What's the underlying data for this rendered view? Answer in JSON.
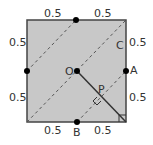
{
  "diagram": {
    "colors": {
      "fill": "#c8c8c8",
      "border": "#444444",
      "dashed": "#555555",
      "solid": "#333333",
      "point": "#000000",
      "text": "#333333"
    },
    "square": {
      "x1": 27,
      "y1": 20,
      "x2": 126,
      "y2": 122
    },
    "points": [
      {
        "id": "top-mid",
        "label": "",
        "x": 76,
        "y": 20
      },
      {
        "id": "left-mid",
        "label": "",
        "x": 27,
        "y": 71
      },
      {
        "id": "O",
        "label": "O",
        "x": 77,
        "y": 71
      },
      {
        "id": "A",
        "label": "A",
        "x": 126,
        "y": 71
      },
      {
        "id": "B",
        "label": "B",
        "x": 77,
        "y": 122
      }
    ],
    "labels": {
      "O": "O",
      "A": "A",
      "B": "B",
      "C": "C",
      "P": "P"
    },
    "side_labels": {
      "top_left": "0.5",
      "top_right": "0.5",
      "left_top": "0.5",
      "left_bottom": "0.5",
      "right_top": "0.5",
      "right_bottom": "0.5",
      "bottom_left": "0.5",
      "bottom_right": "0.5"
    }
  }
}
